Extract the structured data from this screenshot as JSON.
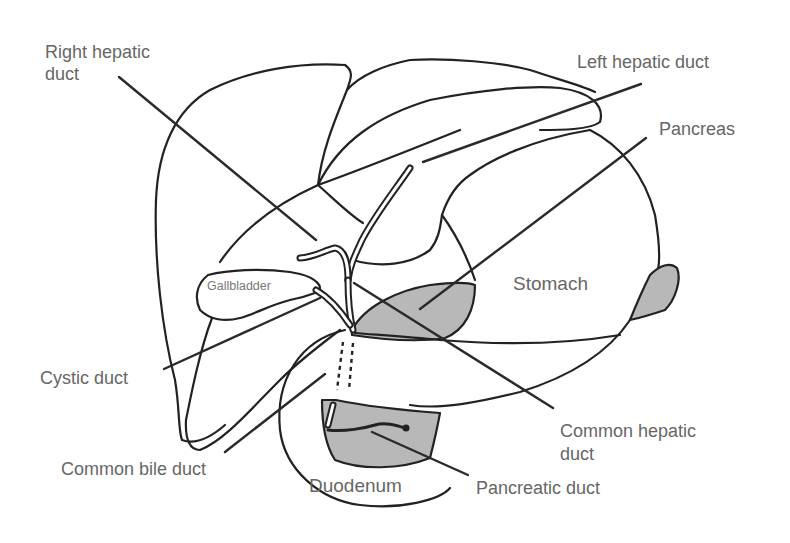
{
  "diagram": {
    "colors": {
      "outline": "#222222",
      "shaded": "#b8b8b8",
      "label": "#666666",
      "background": "#ffffff"
    },
    "labels": {
      "right_hepatic_duct": {
        "line1": "Right hepatic",
        "line2": "duct"
      },
      "left_hepatic_duct": "Left hepatic duct",
      "pancreas": "Pancreas",
      "gallbladder": "Gallbladder",
      "stomach": "Stomach",
      "cystic_duct": "Cystic duct",
      "common_hepatic_duct": {
        "line1": "Common hepatic",
        "line2": "duct"
      },
      "common_bile_duct": "Common bile duct",
      "duodenum": "Duodenum",
      "pancreatic_duct": "Pancreatic duct"
    }
  }
}
